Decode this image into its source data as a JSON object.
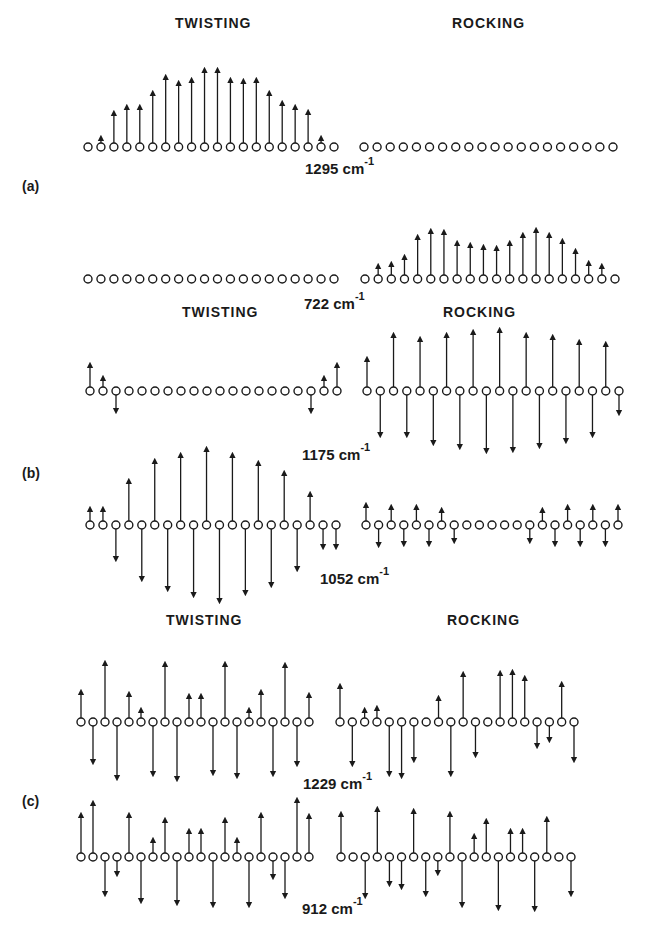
{
  "headers": {
    "twisting": "TWISTING",
    "rocking": "ROCKING"
  },
  "panels": [
    {
      "label": "(a)",
      "x": 22,
      "y": 178
    },
    {
      "label": "(b)",
      "x": 22,
      "y": 465
    },
    {
      "label": "(c)",
      "x": 22,
      "y": 793
    }
  ],
  "header_positions": [
    {
      "text_key": "twisting",
      "x": 175,
      "y": 15
    },
    {
      "text_key": "rocking",
      "x": 452,
      "y": 15
    },
    {
      "text_key": "twisting",
      "x": 182,
      "y": 304
    },
    {
      "text_key": "rocking",
      "x": 443,
      "y": 304
    },
    {
      "text_key": "twisting",
      "x": 166,
      "y": 612
    },
    {
      "text_key": "rocking",
      "x": 447,
      "y": 612
    }
  ],
  "frequencies": [
    {
      "value": "1295",
      "unit": "cm",
      "exp": "-1",
      "x": 305,
      "y": 158
    },
    {
      "value": "722",
      "unit": "cm",
      "exp": "-1",
      "x": 304,
      "y": 293
    },
    {
      "value": "1175",
      "unit": "cm",
      "exp": "-1",
      "x": 302,
      "y": 444
    },
    {
      "value": "1052",
      "unit": "cm",
      "exp": "-1",
      "x": 320,
      "y": 568
    },
    {
      "value": "1229",
      "unit": "cm",
      "exp": "-1",
      "x": 303,
      "y": 773
    },
    {
      "value": "912",
      "unit": "cm",
      "exp": "-1",
      "x": 302,
      "y": 898
    }
  ],
  "chains": [
    {
      "id": "a-1295-twisting",
      "y": 147,
      "x0": 88,
      "x1": 334,
      "amps": [
        0,
        5,
        30,
        36,
        36,
        50,
        66,
        60,
        63,
        73,
        73,
        63,
        62,
        63,
        50,
        40,
        36,
        31,
        5,
        0
      ]
    },
    {
      "id": "a-1295-rocking",
      "y": 147,
      "x0": 364,
      "x1": 613,
      "amps": [
        0,
        0,
        0,
        0,
        0,
        0,
        0,
        0,
        0,
        0,
        0,
        0,
        0,
        0,
        0,
        0,
        0,
        0,
        0,
        0
      ]
    },
    {
      "id": "a-722-twisting",
      "y": 279,
      "x0": 88,
      "x1": 334,
      "amps": [
        0,
        0,
        0,
        0,
        0,
        0,
        0,
        0,
        0,
        0,
        0,
        0,
        0,
        0,
        0,
        0,
        0,
        0,
        0,
        0
      ]
    },
    {
      "id": "a-722-rocking",
      "y": 279,
      "x0": 365,
      "x1": 615,
      "amps": [
        0,
        9,
        11,
        18,
        38,
        44,
        43,
        32,
        30,
        28,
        27,
        32,
        40,
        45,
        40,
        34,
        24,
        12,
        9,
        0
      ]
    },
    {
      "id": "b-1175-twisting",
      "y": 391,
      "x0": 90,
      "x1": 337,
      "amps": [
        22,
        9,
        -16,
        0,
        0,
        0,
        0,
        0,
        0,
        0,
        0,
        0,
        0,
        0,
        0,
        0,
        0,
        -16,
        9,
        22
      ]
    },
    {
      "id": "b-1175-rocking",
      "y": 391,
      "x0": 367,
      "x1": 619,
      "amps": [
        28,
        -40,
        52,
        -40,
        48,
        -48,
        52,
        -52,
        55,
        -56,
        57,
        -55,
        52,
        -51,
        50,
        -46,
        45,
        -40,
        43,
        -18
      ]
    },
    {
      "id": "b-1052-twisting",
      "y": 525,
      "x0": 90,
      "x1": 336,
      "amps": [
        12,
        12,
        -30,
        40,
        -50,
        60,
        -60,
        66,
        -66,
        72,
        -72,
        66,
        -64,
        58,
        -56,
        48,
        -40,
        27,
        -18,
        -18
      ]
    },
    {
      "id": "b-1052-rocking",
      "y": 525,
      "x0": 366,
      "x1": 618,
      "amps": [
        16,
        -16,
        14,
        -15,
        14,
        -15,
        11,
        -12,
        0,
        0,
        0,
        0,
        0,
        -12,
        11,
        -15,
        14,
        -15,
        14,
        -15,
        14
      ]
    },
    {
      "id": "c-1229-twisting",
      "y": 722,
      "x0": 81,
      "x1": 309,
      "amps": [
        26,
        -36,
        55,
        -52,
        24,
        8,
        -48,
        54,
        -53,
        22,
        22,
        -47,
        54,
        -50,
        8,
        26,
        -48,
        53,
        -38,
        23
      ]
    },
    {
      "id": "c-1229-rocking",
      "y": 722,
      "x0": 340,
      "x1": 574,
      "amps": [
        32,
        -38,
        8,
        10,
        -48,
        -50,
        -34,
        0,
        20,
        -48,
        44,
        -29,
        0,
        45,
        46,
        40,
        -20,
        -14,
        34,
        -34
      ]
    },
    {
      "id": "c-912-twisting",
      "y": 857,
      "x0": 81,
      "x1": 309,
      "amps": [
        38,
        50,
        -33,
        -13,
        38,
        -40,
        13,
        33,
        -42,
        22,
        22,
        -44,
        33,
        13,
        -44,
        38,
        -16,
        -35,
        53,
        37
      ]
    },
    {
      "id": "c-912-rocking",
      "y": 857,
      "x0": 341,
      "x1": 571,
      "amps": [
        39,
        0,
        -35,
        44,
        -23,
        -26,
        42,
        -33,
        -12,
        39,
        -44,
        17,
        32,
        -47,
        22,
        22,
        -48,
        34,
        0,
        -33
      ]
    }
  ],
  "style": {
    "ink": "#1a1a1a",
    "background": "#ffffff"
  }
}
